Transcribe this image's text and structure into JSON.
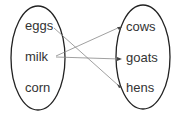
{
  "domain_set": {
    "left": [
      "eggs",
      "milk",
      "corn"
    ],
    "right": [
      "cows",
      "goats",
      "hens"
    ]
  },
  "mappings": [
    {
      "from": "eggs",
      "to": "hens"
    },
    {
      "from": "milk",
      "to": "cows"
    },
    {
      "from": "milk",
      "to": "goats"
    }
  ],
  "colors": {
    "ellipse": "#222222",
    "arrow": "#888888",
    "text": "#333333"
  }
}
